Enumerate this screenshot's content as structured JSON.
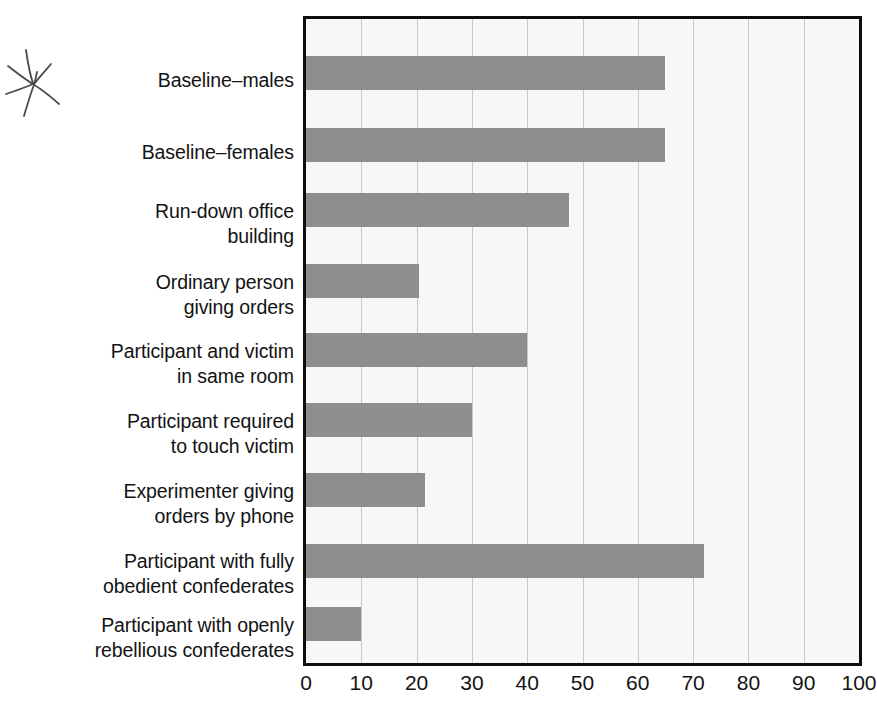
{
  "annotation": {
    "mark": "hand-drawn-asterisk"
  },
  "chart_data": {
    "type": "bar",
    "orientation": "horizontal",
    "title": "",
    "subtitle": "",
    "xlabel": "",
    "ylabel": "",
    "xlim": [
      0,
      100
    ],
    "xticks": [
      0,
      10,
      20,
      30,
      40,
      50,
      60,
      70,
      80,
      90,
      100
    ],
    "xtick_labels": [
      "0",
      "10",
      "20",
      "30",
      "40",
      "50",
      "60",
      "70",
      "80",
      "90",
      "100"
    ],
    "grid": "vertical",
    "legend": "none",
    "bar_color": "#8e8e8e",
    "plot_background": "#f7f7f5",
    "frame_color": "#0d0d0d",
    "categories": [
      "Baseline–males",
      "Baseline–females",
      "Run-down office building",
      "Ordinary person giving orders",
      "Participant and victim in same room",
      "Participant required to touch victim",
      "Experimenter giving orders by phone",
      "Participant with fully obedient confederates",
      "Participant with openly rebellious confederates"
    ],
    "category_lines": [
      [
        "Baseline–males"
      ],
      [
        "Baseline–females"
      ],
      [
        "Run-down office",
        "building"
      ],
      [
        "Ordinary person",
        "giving orders"
      ],
      [
        "Participant and victim",
        "in same room"
      ],
      [
        "Participant required",
        "to touch victim"
      ],
      [
        "Experimenter giving",
        "orders by phone"
      ],
      [
        "Participant with fully",
        "obedient confederates"
      ],
      [
        "Participant with openly",
        "rebellious confederates"
      ]
    ],
    "values": [
      65,
      65,
      47.5,
      20.5,
      40,
      30,
      21.5,
      72,
      10
    ]
  }
}
